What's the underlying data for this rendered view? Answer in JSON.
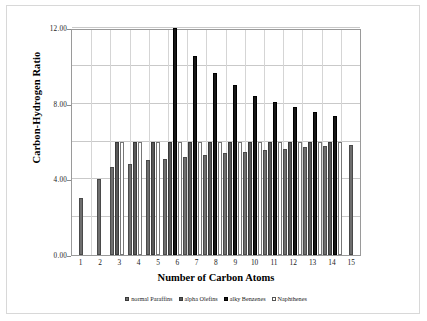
{
  "chart_data": {
    "type": "bar",
    "title": "",
    "xlabel": "Number of Carbon Atoms",
    "ylabel": "Carbon-Hydrogen Ratio",
    "categories": [
      "1",
      "2",
      "3",
      "4",
      "5",
      "6",
      "7",
      "8",
      "9",
      "10",
      "11",
      "12",
      "13",
      "14",
      "15"
    ],
    "ylim": [
      0.0,
      12.0
    ],
    "yticks": [
      "0.00",
      "4.00",
      "8.00",
      "12.00"
    ],
    "ytick_values": [
      0.0,
      4.0,
      8.0,
      12.0
    ],
    "gridlines": [
      2.0,
      4.0,
      6.0,
      8.0,
      10.0,
      12.0
    ],
    "grid": true,
    "legend_position": "bottom",
    "series": [
      {
        "name": "normal Paraffins",
        "color": "#6e6e6e",
        "values": [
          3.0,
          4.0,
          4.67,
          4.8,
          5.0,
          5.1,
          5.2,
          5.3,
          5.4,
          5.45,
          5.55,
          5.6,
          5.7,
          5.75,
          5.83
        ]
      },
      {
        "name": "alpha Olefins",
        "color": "#595959",
        "values": [
          null,
          null,
          6.0,
          6.0,
          6.0,
          6.0,
          6.0,
          6.0,
          6.0,
          6.0,
          6.0,
          6.0,
          6.0,
          6.0,
          null
        ]
      },
      {
        "name": "alky Benzenes",
        "color": "#171717",
        "values": [
          null,
          null,
          null,
          null,
          null,
          12.0,
          10.5,
          9.6,
          9.0,
          8.4,
          8.1,
          7.8,
          7.55,
          7.35,
          null
        ]
      },
      {
        "name": "Naphthenes",
        "color": "#ffffff",
        "values": [
          null,
          null,
          6.0,
          6.0,
          6.0,
          6.0,
          6.0,
          6.0,
          6.0,
          6.0,
          6.0,
          6.0,
          6.0,
          6.0,
          null
        ]
      }
    ]
  },
  "legend": {
    "items": [
      {
        "label": "normal Paraffins"
      },
      {
        "label": "alpha Olefins"
      },
      {
        "label": "alky Benzenes"
      },
      {
        "label": "Naphthenes"
      }
    ]
  }
}
